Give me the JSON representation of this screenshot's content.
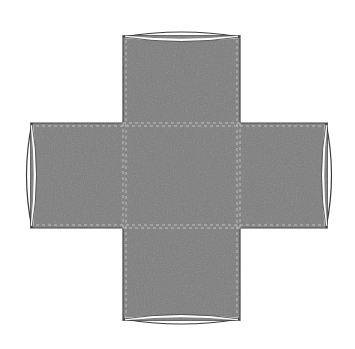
{
  "diagram": {
    "type": "cross-shaped net with curved arm ends",
    "colors": {
      "fill": "#7f7f7f",
      "stroke": "#3a3a3a",
      "fold_line": "#c8c8c8",
      "cap_highlight": "#ffffff",
      "background": "#ffffff"
    },
    "center_square": {
      "x": 123,
      "y": 123,
      "w": 117,
      "h": 105
    },
    "arms": [
      {
        "name": "top",
        "x": 123,
        "y": 33,
        "w": 117,
        "h": 90
      },
      {
        "name": "left",
        "x": 28,
        "y": 123,
        "w": 95,
        "h": 105
      },
      {
        "name": "right",
        "x": 240,
        "y": 123,
        "w": 90,
        "h": 105
      },
      {
        "name": "bottom",
        "x": 123,
        "y": 228,
        "w": 117,
        "h": 95
      }
    ]
  }
}
